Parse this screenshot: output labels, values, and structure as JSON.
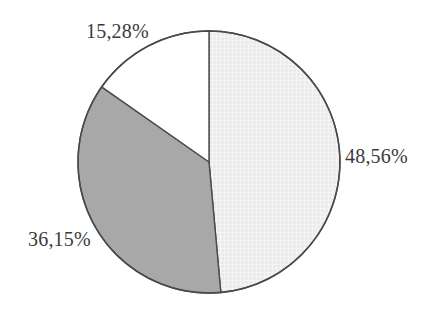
{
  "chart_data": {
    "type": "pie",
    "title": "",
    "subtitle": "",
    "xlabel": "",
    "ylabel": "",
    "grid": false,
    "legend": "none",
    "label_position": "outside",
    "start_angle_deg": 0,
    "direction": "clockwise",
    "units": "percent",
    "decimal_separator": ",",
    "total": 99.99,
    "categories": [
      "48,56%",
      "36,15%",
      "15,28%"
    ],
    "values": [
      48.56,
      36.15,
      15.28
    ],
    "slices": [
      {
        "label": "48,56%",
        "value": 48.56,
        "fill": "#ececec",
        "pattern": "fine-crosshatch",
        "stroke": "#4a4a4a",
        "start_deg": 0.0,
        "end_deg": 174.82
      },
      {
        "label": "36,15%",
        "value": 36.15,
        "fill": "#a8a8a8",
        "pattern": "solid",
        "stroke": "#4a4a4a",
        "start_deg": 174.82,
        "end_deg": 304.96
      },
      {
        "label": "15,28%",
        "value": 15.28,
        "fill": "#ffffff",
        "pattern": "solid",
        "stroke": "#4a4a4a",
        "start_deg": 304.96,
        "end_deg": 360.0
      }
    ],
    "geometry": {
      "center_x": 209,
      "center_y": 162,
      "radius": 131
    },
    "colors": {
      "background": "#ffffff",
      "outline": "#4a4a4a",
      "text": "#3b3b3b",
      "slice_light": "#ececec",
      "slice_gray": "#a8a8a8",
      "slice_white": "#ffffff"
    }
  }
}
